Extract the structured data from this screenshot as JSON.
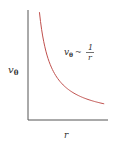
{
  "chart_data": {
    "type": "line",
    "title": "",
    "xlabel": "r",
    "ylabel": "v_θ",
    "ylabel_main": "v",
    "ylabel_sub": "θ",
    "annotation": {
      "lhs_main": "v",
      "lhs_sub": "θ",
      "relation": "~",
      "numerator": "1",
      "denominator": "r"
    },
    "series": [
      {
        "name": "v_θ ~ 1/r",
        "function": "1/r",
        "color": "#c0504d",
        "x": [
          0.15,
          0.2,
          0.3,
          0.4,
          0.5,
          0.6,
          0.7,
          0.8,
          0.9,
          1.0
        ],
        "values": [
          6.67,
          5.0,
          3.33,
          2.5,
          2.0,
          1.67,
          1.43,
          1.25,
          1.11,
          1.0
        ]
      }
    ],
    "xlim": [
      0,
      1.05
    ],
    "ylim": [
      0,
      6.8
    ],
    "grid": false,
    "ticks": false
  }
}
